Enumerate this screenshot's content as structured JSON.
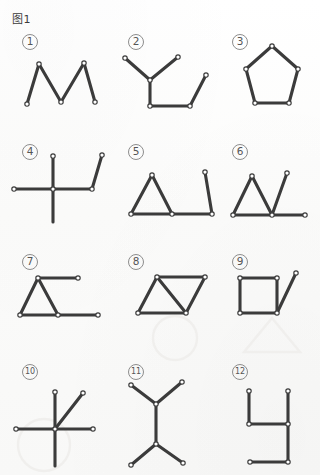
{
  "page": {
    "title": "图1",
    "width": 320,
    "height": 475,
    "background_color": "#fcfcfb",
    "stroke_color": "#3b3b3b",
    "node_fill_color": "#ffffff",
    "node_stroke_color": "#3b3b3b",
    "watermark_color": "#f0efed"
  },
  "items": [
    {
      "id": 1,
      "label": "①",
      "label_text": "1",
      "label_x": 22,
      "label_y": 34,
      "name": "figure-item-1",
      "shape": "zigzag-w",
      "shape_description": "zigzag W with five vertices, five segments"
    },
    {
      "id": 2,
      "label": "②",
      "label_text": "2",
      "label_x": 128,
      "label_y": 34,
      "name": "figure-item-2",
      "shape": "branch-and-trough",
      "shape_description": "three-way branch joined to a U-shaped trough"
    },
    {
      "id": 3,
      "label": "③",
      "label_text": "3",
      "label_x": 232,
      "label_y": 34,
      "name": "figure-item-3",
      "shape": "pentagon",
      "shape_description": "closed regular pentagon with five vertices"
    },
    {
      "id": 4,
      "label": "④",
      "label_text": "4",
      "label_x": 22,
      "label_y": 144,
      "name": "figure-item-4",
      "shape": "cross-with-bent-arm",
      "shape_description": "plus/cross with an extra bent arm to the right"
    },
    {
      "id": 5,
      "label": "⑤",
      "label_text": "5",
      "label_x": 128,
      "label_y": 144,
      "name": "figure-item-5",
      "shape": "triangle-with-tail",
      "shape_description": "triangle with a horizontal tail and a rising end segment"
    },
    {
      "id": 6,
      "label": "⑥",
      "label_text": "6",
      "label_x": 232,
      "label_y": 144,
      "name": "figure-item-6",
      "shape": "triangle-v-tail",
      "shape_description": "triangle followed by a V and a horizontal tail"
    },
    {
      "id": 7,
      "label": "⑦",
      "label_text": "7",
      "label_x": 22,
      "label_y": 254,
      "name": "figure-item-7",
      "shape": "triangle-two-tails",
      "shape_description": "triangle with two horizontal tails to the right"
    },
    {
      "id": 8,
      "label": "⑧",
      "label_text": "8",
      "label_x": 128,
      "label_y": 254,
      "name": "figure-item-8",
      "shape": "parallelogram-diagonal",
      "shape_description": "parallelogram with one internal diagonal"
    },
    {
      "id": 9,
      "label": "⑨",
      "label_text": "9",
      "label_x": 232,
      "label_y": 254,
      "name": "figure-item-9",
      "shape": "square-with-tail",
      "shape_description": "square with a diagonal tail from the lower-right corner"
    },
    {
      "id": 10,
      "label": "⑩",
      "label_text": "10",
      "label_x": 22,
      "label_y": 364,
      "name": "figure-item-10",
      "shape": "five-spoke-star",
      "shape_description": "five spokes radiating from one central point"
    },
    {
      "id": 11,
      "label": "⑪",
      "label_text": "11",
      "label_x": 128,
      "label_y": 364,
      "name": "figure-item-11",
      "shape": "double-y",
      "shape_description": "two opposed Y branches joined by a vertical stem"
    },
    {
      "id": 12,
      "label": "⑫",
      "label_text": "12",
      "label_x": 232,
      "label_y": 364,
      "name": "figure-item-12",
      "shape": "h-shape",
      "shape_description": "h-like figure of six straight segments"
    }
  ],
  "geometry": {
    "fig1": {
      "points": [
        [
          27,
          104
        ],
        [
          39,
          64
        ],
        [
          61,
          102
        ],
        [
          84,
          63
        ],
        [
          95,
          102
        ]
      ],
      "segments": [
        [
          0,
          1
        ],
        [
          1,
          2
        ],
        [
          2,
          3
        ],
        [
          3,
          4
        ]
      ],
      "nodes": [
        [
          39,
          64
        ],
        [
          61,
          102
        ],
        [
          84,
          63
        ],
        [
          95,
          102
        ],
        [
          27,
          104
        ]
      ]
    },
    "fig2": {
      "points": [
        [
          125,
          58
        ],
        [
          150,
          80
        ],
        [
          178,
          57
        ],
        [
          150,
          106
        ],
        [
          190,
          106
        ],
        [
          206,
          75
        ]
      ],
      "segments": [
        [
          0,
          1
        ],
        [
          1,
          2
        ],
        [
          1,
          3
        ],
        [
          3,
          4
        ],
        [
          4,
          5
        ]
      ],
      "nodes": [
        [
          125,
          58
        ],
        [
          150,
          80
        ],
        [
          178,
          57
        ],
        [
          150,
          106
        ],
        [
          190,
          106
        ],
        [
          206,
          75
        ]
      ]
    },
    "fig3": {
      "points": [
        [
          272,
          46
        ],
        [
          298,
          69
        ],
        [
          289,
          103
        ],
        [
          255,
          103
        ],
        [
          246,
          69
        ]
      ],
      "segments": [
        [
          0,
          1
        ],
        [
          1,
          2
        ],
        [
          2,
          3
        ],
        [
          3,
          4
        ],
        [
          4,
          0
        ]
      ],
      "nodes": [
        [
          272,
          46
        ],
        [
          298,
          69
        ],
        [
          289,
          103
        ],
        [
          255,
          103
        ],
        [
          246,
          69
        ]
      ]
    },
    "fig4": {
      "points": [
        [
          53,
          189
        ],
        [
          53,
          156
        ],
        [
          53,
          222
        ],
        [
          14,
          189
        ],
        [
          92,
          189
        ],
        [
          92,
          189
        ],
        [
          102,
          155
        ]
      ],
      "segments": [
        [
          0,
          1
        ],
        [
          0,
          2
        ],
        [
          0,
          3
        ],
        [
          0,
          4
        ],
        [
          4,
          6
        ]
      ],
      "nodes": [
        [
          53,
          189
        ],
        [
          53,
          156
        ],
        [
          14,
          189
        ],
        [
          92,
          189
        ],
        [
          102,
          155
        ]
      ]
    },
    "fig5": {
      "points": [
        [
          131,
          214
        ],
        [
          152,
          175
        ],
        [
          172,
          214
        ],
        [
          212,
          214
        ],
        [
          205,
          172
        ]
      ],
      "segments": [
        [
          0,
          1
        ],
        [
          1,
          2
        ],
        [
          0,
          2
        ],
        [
          2,
          3
        ],
        [
          3,
          4
        ]
      ],
      "nodes": [
        [
          131,
          214
        ],
        [
          152,
          175
        ],
        [
          172,
          214
        ],
        [
          212,
          214
        ],
        [
          205,
          172
        ]
      ]
    },
    "fig6": {
      "points": [
        [
          233,
          215
        ],
        [
          252,
          176
        ],
        [
          272,
          215
        ],
        [
          287,
          173
        ],
        [
          305,
          215
        ]
      ],
      "segments": [
        [
          0,
          1
        ],
        [
          1,
          2
        ],
        [
          0,
          2
        ],
        [
          2,
          3
        ],
        [
          2,
          4
        ]
      ],
      "nodes": [
        [
          233,
          215
        ],
        [
          252,
          176
        ],
        [
          272,
          215
        ],
        [
          287,
          173
        ],
        [
          305,
          215
        ]
      ]
    },
    "fig7": {
      "points": [
        [
          20,
          315
        ],
        [
          38,
          278
        ],
        [
          58,
          315
        ],
        [
          78,
          278
        ],
        [
          98,
          315
        ]
      ],
      "segments": [
        [
          0,
          1
        ],
        [
          1,
          2
        ],
        [
          0,
          2
        ],
        [
          1,
          3
        ],
        [
          2,
          4
        ]
      ],
      "nodes": [
        [
          20,
          315
        ],
        [
          38,
          278
        ],
        [
          58,
          315
        ],
        [
          78,
          278
        ],
        [
          98,
          315
        ]
      ]
    },
    "fig8": {
      "points": [
        [
          138,
          313
        ],
        [
          157,
          277
        ],
        [
          205,
          277
        ],
        [
          186,
          313
        ]
      ],
      "segments": [
        [
          0,
          1
        ],
        [
          1,
          2
        ],
        [
          2,
          3
        ],
        [
          3,
          0
        ],
        [
          1,
          3
        ]
      ],
      "nodes": [
        [
          138,
          313
        ],
        [
          157,
          277
        ],
        [
          205,
          277
        ],
        [
          186,
          313
        ]
      ]
    },
    "fig9": {
      "points": [
        [
          240,
          278
        ],
        [
          277,
          278
        ],
        [
          277,
          313
        ],
        [
          240,
          313
        ],
        [
          296,
          273
        ]
      ],
      "segments": [
        [
          0,
          1
        ],
        [
          1,
          2
        ],
        [
          2,
          3
        ],
        [
          3,
          0
        ],
        [
          2,
          4
        ]
      ],
      "nodes": [
        [
          240,
          278
        ],
        [
          277,
          278
        ],
        [
          277,
          313
        ],
        [
          240,
          313
        ],
        [
          296,
          273
        ]
      ]
    },
    "fig10": {
      "points": [
        [
          55,
          429
        ],
        [
          55,
          392
        ],
        [
          55,
          466
        ],
        [
          16,
          429
        ],
        [
          93,
          429
        ],
        [
          83,
          393
        ]
      ],
      "segments": [
        [
          0,
          1
        ],
        [
          0,
          2
        ],
        [
          0,
          3
        ],
        [
          0,
          4
        ],
        [
          0,
          5
        ]
      ],
      "nodes": [
        [
          55,
          429
        ],
        [
          55,
          392
        ],
        [
          16,
          429
        ],
        [
          93,
          429
        ],
        [
          83,
          393
        ]
      ]
    },
    "fig11": {
      "points": [
        [
          156,
          404
        ],
        [
          131,
          385
        ],
        [
          182,
          382
        ],
        [
          156,
          444
        ],
        [
          131,
          465
        ],
        [
          183,
          463
        ]
      ],
      "segments": [
        [
          0,
          1
        ],
        [
          0,
          2
        ],
        [
          0,
          3
        ],
        [
          3,
          4
        ],
        [
          3,
          5
        ]
      ],
      "nodes": [
        [
          156,
          404
        ],
        [
          131,
          385
        ],
        [
          182,
          382
        ],
        [
          156,
          444
        ],
        [
          131,
          465
        ],
        [
          183,
          463
        ]
      ]
    },
    "fig12": {
      "points": [
        [
          249,
          391
        ],
        [
          249,
          424
        ],
        [
          288,
          424
        ],
        [
          288,
          391
        ],
        [
          288,
          462
        ],
        [
          250,
          462
        ]
      ],
      "segments": [
        [
          0,
          1
        ],
        [
          1,
          2
        ],
        [
          2,
          3
        ],
        [
          2,
          4
        ],
        [
          4,
          5
        ]
      ],
      "nodes": [
        [
          249,
          391
        ],
        [
          249,
          424
        ],
        [
          288,
          424
        ],
        [
          288,
          391
        ],
        [
          288,
          462
        ],
        [
          250,
          462
        ]
      ]
    }
  },
  "watermarks": [
    {
      "name": "watermark-circle",
      "shape": "circle",
      "cx": 175,
      "cy": 338,
      "r": 22
    },
    {
      "name": "watermark-triangle",
      "shape": "triangle",
      "points": "272,318 300,352 244,352"
    },
    {
      "name": "watermark-blob-left",
      "shape": "circle",
      "cx": 44,
      "cy": 445,
      "r": 26
    }
  ]
}
